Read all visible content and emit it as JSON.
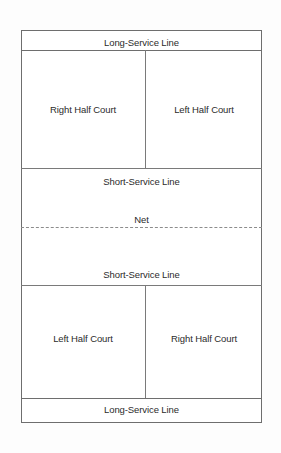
{
  "diagram": {
    "colors": {
      "line": "#6e6e6e",
      "inner_line": "#7a7a7a",
      "net_line": "#8c8c8c",
      "text": "#2b2b2b",
      "background": "#fdfdfd",
      "court_fill": "#ffffff"
    },
    "labels": {
      "long_service_line_top": "Long-Service Line",
      "long_service_line_bottom": "Long-Service Line",
      "short_service_line_top": "Short-Service Line",
      "short_service_line_bottom": "Short-Service Line",
      "net": "Net",
      "top_left_zone": "Right Half Court",
      "top_right_zone": "Left Half Court",
      "bottom_left_zone": "Left Half Court",
      "bottom_right_zone": "Right Half Court"
    }
  }
}
